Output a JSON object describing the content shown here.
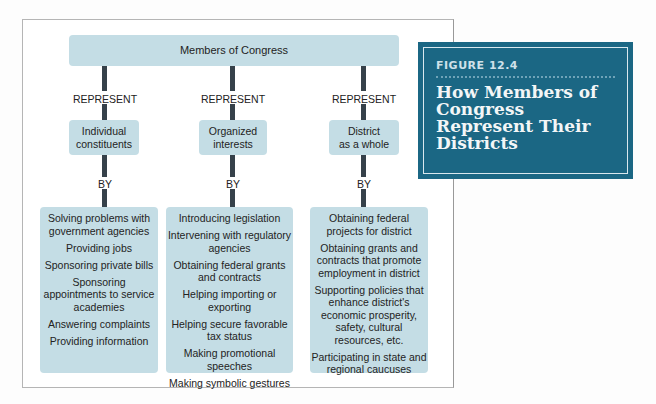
{
  "figure": {
    "number": "FIGURE 12.4",
    "title": "How Members of Congress Represent Their Districts"
  },
  "diagram": {
    "root": "Members of Congress",
    "connector_top": "REPRESENT",
    "connector_bottom": "BY",
    "columns": [
      {
        "group": "Individual constituents",
        "group_lines": [
          "Individual",
          "constituents"
        ],
        "methods": [
          "Solving problems with government agencies",
          "Providing jobs",
          "Sponsoring private bills",
          "Sponsoring appointments to service academies",
          "Answering complaints",
          "Providing information"
        ]
      },
      {
        "group": "Organized interests",
        "group_lines": [
          "Organized",
          "interests"
        ],
        "methods": [
          "Introducing legislation",
          "Intervening with regulatory agencies",
          "Obtaining federal grants and contracts",
          "Helping importing or exporting",
          "Helping secure favorable tax status",
          "Making promotional speeches",
          "Making symbolic gestures"
        ]
      },
      {
        "group": "District as a whole",
        "group_lines": [
          "District",
          "as a whole"
        ],
        "methods": [
          "Obtaining federal projects for district",
          "Obtaining grants and contracts that promote employment in district",
          "Supporting policies that enhance district's economic prosperity, safety, cultural resources, etc.",
          "Participating in state and regional caucuses"
        ]
      }
    ]
  },
  "colors": {
    "box_fill": "#c4dde5",
    "connector": "#36414a",
    "figure_bg": "#1b6784"
  }
}
